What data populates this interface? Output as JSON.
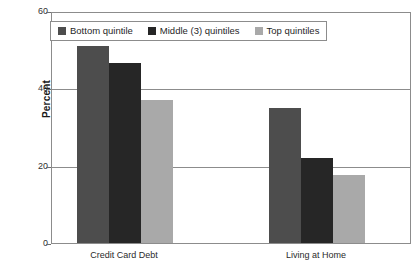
{
  "chart_data": {
    "type": "bar",
    "title": "",
    "xlabel": "",
    "ylabel": "Percent",
    "ylim": [
      0,
      60
    ],
    "yticks": [
      0,
      20,
      40,
      60
    ],
    "ytick_labels": [
      "0",
      "20",
      "40",
      "60"
    ],
    "grid": true,
    "legend_position": "upper-left-inside",
    "categories": [
      "Credit Card Debt",
      "Living at Home"
    ],
    "series": [
      {
        "name": "Bottom quintile",
        "color": "#4d4d4d",
        "values": [
          51,
          35
        ]
      },
      {
        "name": "Middle (3) quintiles",
        "color": "#262626",
        "values": [
          46.5,
          22
        ]
      },
      {
        "name": "Top quintiles",
        "color": "#a9a9a9",
        "values": [
          37,
          17.5
        ]
      }
    ]
  }
}
